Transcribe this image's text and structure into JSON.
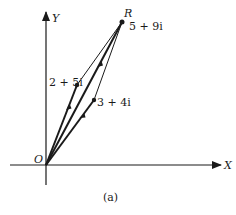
{
  "diagram": {
    "caption": "(a)",
    "axes": {
      "x_label": "X",
      "y_label": "Y",
      "origin_label": "O"
    },
    "points": [
      {
        "id": "R",
        "label": "R",
        "value_label": "5 + 9i",
        "re": 5,
        "im": 9
      },
      {
        "id": "z1",
        "value_label": "2 + 5i",
        "re": 2,
        "im": 5
      },
      {
        "id": "z2",
        "value_label": "3 + 4i",
        "re": 3,
        "im": 4
      }
    ],
    "vectors": [
      {
        "from": "O",
        "to": "2 + 5i"
      },
      {
        "from": "O",
        "to": "3 + 4i"
      },
      {
        "from": "O",
        "to": "5 + 9i"
      }
    ],
    "parallelogram_edges": [
      {
        "from": "2 + 5i",
        "to": "5 + 9i"
      },
      {
        "from": "3 + 4i",
        "to": "5 + 9i"
      }
    ],
    "colors": {
      "ink": "#1a1a1a",
      "background": "#ffffff"
    }
  }
}
